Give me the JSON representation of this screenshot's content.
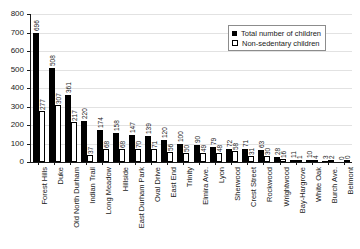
{
  "chart_data": {
    "type": "bar",
    "title": "",
    "xlabel": "",
    "ylabel": "",
    "ylim": [
      0,
      800
    ],
    "yticks": [
      0,
      100,
      200,
      300,
      400,
      500,
      600,
      700,
      800
    ],
    "grid": true,
    "legend_position": "top-right",
    "categories": [
      "Forest Hills",
      "Duke",
      "Old North Durham",
      "Indian Trail",
      "Long Meadow",
      "Hillside",
      "East Durham Park",
      "Oval Drive",
      "East End",
      "Trinity",
      "Elmira Ave.",
      "Lyon",
      "Sherwood",
      "Crest Street",
      "Rockwood",
      "Wrightwood",
      "Bay-Hargrove",
      "White Oak",
      "Burch Ave.",
      "Belmont"
    ],
    "series": [
      {
        "name": "Total number of children",
        "color": "#000000",
        "style": "filled",
        "values": [
          696,
          508,
          361,
          220,
          174,
          158,
          147,
          139,
          120,
          100,
          90,
          79,
          72,
          71,
          63,
          28,
          11,
          10,
          3,
          0
        ]
      },
      {
        "name": "Non-sedentary children",
        "color": "#ffffff",
        "style": "open",
        "values": [
          277,
          307,
          217,
          37,
          68,
          68,
          70,
          71,
          56,
          50,
          49,
          48,
          58,
          31,
          30,
          16,
          1,
          4,
          2,
          0
        ]
      }
    ]
  },
  "legend": {
    "items": [
      {
        "label": "Total number of children",
        "swatch": "filled-square-icon"
      },
      {
        "label": "Non-sedentary children",
        "swatch": "open-square-icon"
      }
    ]
  }
}
